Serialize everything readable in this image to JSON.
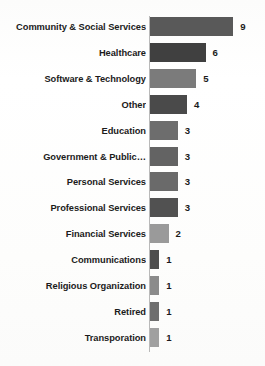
{
  "chart_data": {
    "type": "bar",
    "orientation": "horizontal",
    "title": "",
    "subtitle": "",
    "xlabel": "",
    "ylabel": "",
    "xlim": [
      0,
      9
    ],
    "grid": false,
    "legend": null,
    "categories": [
      "Community & Social Services",
      "Healthcare",
      "Software & Technology",
      "Other",
      "Education",
      "Government & Public…",
      "Personal Services",
      "Professional Services",
      "Financial Services",
      "Communications",
      "Religious Organization",
      "Retired",
      "Transporation"
    ],
    "values": [
      9,
      6,
      5,
      4,
      3,
      3,
      3,
      3,
      2,
      1,
      1,
      1,
      1
    ],
    "value_labels": [
      "9",
      "6",
      "5",
      "4",
      "3",
      "3",
      "3",
      "3",
      "2",
      "1",
      "1",
      "1",
      "1"
    ],
    "bar_colors": [
      "#595959",
      "#404040",
      "#7b7b7b",
      "#4a4a4a",
      "#6d6d6d",
      "#636363",
      "#6a6a6a",
      "#515151",
      "#9a9a9a",
      "#4d4d4d",
      "#8b8b8b",
      "#6e6e6e",
      "#a0a0a0"
    ],
    "axis_color": "#b9b9b9",
    "label_color": "#1b1b1b",
    "background_color": "#fdfdfd"
  }
}
